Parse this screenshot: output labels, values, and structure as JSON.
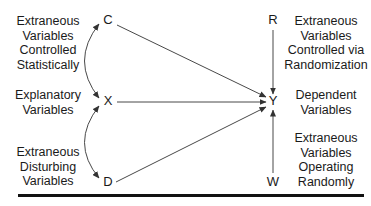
{
  "diagram": {
    "nodes": {
      "C": "C",
      "X": "X",
      "D": "D",
      "R": "R",
      "Y": "Y",
      "W": "W"
    },
    "labels": {
      "controlled_statistically": [
        "Extraneous",
        "Variables",
        "Controlled",
        "Statistically"
      ],
      "explanatory": [
        "Explanatory",
        "Variables"
      ],
      "disturbing": [
        "Extraneous",
        "Disturbing",
        "Variables"
      ],
      "randomization": [
        "Extraneous",
        "Variables",
        "Controlled via",
        "Randomization"
      ],
      "dependent": [
        "Dependent",
        "Variables"
      ],
      "operating_randomly": [
        "Extraneous",
        "Variables",
        "Operating",
        "Randomly"
      ]
    },
    "edges": [
      {
        "from": "C",
        "to": "Y",
        "type": "directed"
      },
      {
        "from": "X",
        "to": "Y",
        "type": "directed"
      },
      {
        "from": "D",
        "to": "Y",
        "type": "directed"
      },
      {
        "from": "R",
        "to": "Y",
        "type": "directed"
      },
      {
        "from": "W",
        "to": "Y",
        "type": "directed"
      },
      {
        "from": "C",
        "to": "X",
        "type": "bidirectional-curved"
      },
      {
        "from": "X",
        "to": "D",
        "type": "bidirectional-curved"
      }
    ],
    "colors": {
      "line": "#333333",
      "text": "#1a1a1a",
      "rule": "#111111"
    }
  }
}
